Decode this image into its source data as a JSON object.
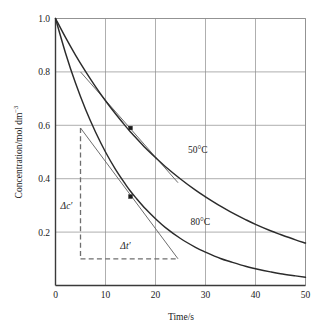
{
  "chart_data": {
    "type": "line",
    "title": "",
    "subtitle": "",
    "xlabel": "Time/s",
    "ylabel": "Concentration/mol dm",
    "ylabel_exponent": "−3",
    "xlim": [
      0,
      50
    ],
    "ylim": [
      0,
      1.0
    ],
    "grid": true,
    "legend_position": "inline-labels",
    "xticks": [
      "0",
      "10",
      "20",
      "30",
      "40",
      "50"
    ],
    "xtick_values": [
      0,
      10,
      20,
      30,
      40,
      50
    ],
    "yticks": [
      "0.2",
      "0.4",
      "0.6",
      "0.8",
      "1.0"
    ],
    "ytick_values": [
      0.2,
      0.4,
      0.6,
      0.8,
      1.0
    ],
    "x": [
      0,
      2,
      4,
      6,
      8,
      10,
      12,
      14,
      15,
      16,
      18,
      20,
      22,
      25,
      28,
      30,
      33,
      35,
      38,
      40,
      43,
      45,
      48,
      50
    ],
    "series": [
      {
        "name": "50°C",
        "label": "50°C",
        "label_x": 26.5,
        "label_y": 0.495,
        "color": "#2b2b2b",
        "values": [
          1.0,
          0.929,
          0.863,
          0.802,
          0.745,
          0.692,
          0.643,
          0.597,
          0.575,
          0.555,
          0.515,
          0.479,
          0.445,
          0.399,
          0.357,
          0.332,
          0.297,
          0.276,
          0.247,
          0.229,
          0.205,
          0.191,
          0.171,
          0.159
        ]
      },
      {
        "name": "80°C",
        "label": "80°C",
        "label_x": 27.0,
        "label_y": 0.225,
        "color": "#2b2b2b",
        "values": [
          1.0,
          0.871,
          0.758,
          0.66,
          0.575,
          0.5,
          0.435,
          0.379,
          0.353,
          0.33,
          0.287,
          0.25,
          0.217,
          0.176,
          0.143,
          0.125,
          0.101,
          0.089,
          0.072,
          0.063,
          0.051,
          0.044,
          0.036,
          0.031
        ]
      }
    ],
    "markers": [
      {
        "name": "tangent-point-50C",
        "x": 15,
        "y": 0.59,
        "shape": "square",
        "color": "#1a1a1a"
      },
      {
        "name": "tangent-point-80C",
        "x": 15,
        "y": 0.333,
        "shape": "square",
        "color": "#1a1a1a"
      }
    ],
    "tangents": [
      {
        "name": "tangent-line-50C",
        "x0": 5.0,
        "y0": 0.8,
        "x1": 24.5,
        "y1": 0.385
      },
      {
        "name": "tangent-line-80C",
        "x0": 5.0,
        "y0": 0.59,
        "x1": 24.5,
        "y1": 0.1
      }
    ],
    "annotations": [
      {
        "name": "delta-c-label",
        "text": "Δc′",
        "x": 2.2,
        "y": 0.285
      },
      {
        "name": "delta-t-label",
        "text": "Δt′",
        "x": 14.0,
        "y": 0.135
      }
    ],
    "guides": [
      {
        "name": "delta-c-guide",
        "orientation": "vertical",
        "x": 5.0,
        "y_from": 0.59,
        "y_to": 0.1,
        "style": "dashed"
      },
      {
        "name": "delta-t-guide",
        "orientation": "horizontal",
        "y": 0.1,
        "x_from": 5.0,
        "x_to": 24.5,
        "style": "dashed"
      }
    ]
  },
  "colors": {
    "background": "#ffffff",
    "curve": "#2b2b2b",
    "tangent": "#5c5c5c",
    "grid": "#8c8c8c",
    "axis": "#3a3a3a",
    "guide": "#6e6e6e",
    "text": "#1a1a1a"
  }
}
